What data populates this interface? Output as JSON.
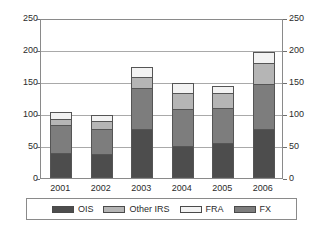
{
  "chart_data": {
    "type": "bar",
    "subtype": "stacked",
    "title": "",
    "subtitle": "",
    "xlabel": "",
    "ylabel": "",
    "categories": [
      "2001",
      "2002",
      "2003",
      "2004",
      "2005",
      "2006"
    ],
    "ylim": [
      0,
      250
    ],
    "yticks": [
      0,
      50,
      100,
      150,
      200,
      250
    ],
    "ytick_labels": [
      "0",
      "50",
      "100",
      "150",
      "200",
      "250"
    ],
    "right_axis": {
      "ylim": [
        0,
        250
      ],
      "yticks": [
        0,
        50,
        100,
        150,
        200,
        250
      ],
      "ytick_labels": [
        "0",
        "50",
        "100",
        "150",
        "200",
        "250"
      ]
    },
    "grid": true,
    "grid_axis": "y",
    "legend_position": "bottom",
    "stack_order_bottom_to_top": [
      "OIS",
      "FX",
      "Other IRS",
      "FRA"
    ],
    "series": [
      {
        "name": "OIS",
        "color": "#4d4d4d",
        "values": [
          39,
          38,
          78,
          50,
          55,
          77
        ]
      },
      {
        "name": "FX",
        "color": "#7d7d7d",
        "values": [
          45,
          40,
          64,
          59,
          56,
          71
        ]
      },
      {
        "name": "Other IRS",
        "color": "#b5b5b5",
        "values": [
          10,
          12,
          18,
          26,
          24,
          34
        ]
      },
      {
        "name": "FRA",
        "color": "#f2f2f2",
        "values": [
          11,
          10,
          15,
          15,
          11,
          18
        ]
      }
    ],
    "totals": [
      105,
      100,
      175,
      150,
      146,
      200
    ],
    "annotations": []
  },
  "legend": {
    "items": [
      {
        "label": "OIS",
        "color": "#4d4d4d"
      },
      {
        "label": "Other IRS",
        "color": "#b5b5b5"
      },
      {
        "label": "FRA",
        "color": "#f2f2f2"
      },
      {
        "label": "FX",
        "color": "#7d7d7d"
      }
    ]
  }
}
